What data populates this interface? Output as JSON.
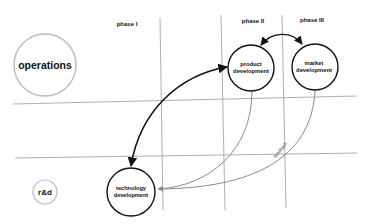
{
  "phases": [
    {
      "label": "phase I"
    },
    {
      "label": "phase II"
    },
    {
      "label": "phase III"
    }
  ],
  "rows": [
    {
      "label": "operations"
    },
    {
      "label": "r&d"
    }
  ],
  "nodes": {
    "product": {
      "line1": "product",
      "line2": "development"
    },
    "market": {
      "line1": "market",
      "line2": "development"
    },
    "technology": {
      "line1": "technology",
      "line2": "development"
    }
  },
  "edges": {
    "feedback_label": "feedback"
  },
  "colors": {
    "grid": "#9a9a9a",
    "primary_arrow": "#111111",
    "feedback_arrow": "#8a8a8a",
    "row_circle": "#bdbdbd"
  }
}
